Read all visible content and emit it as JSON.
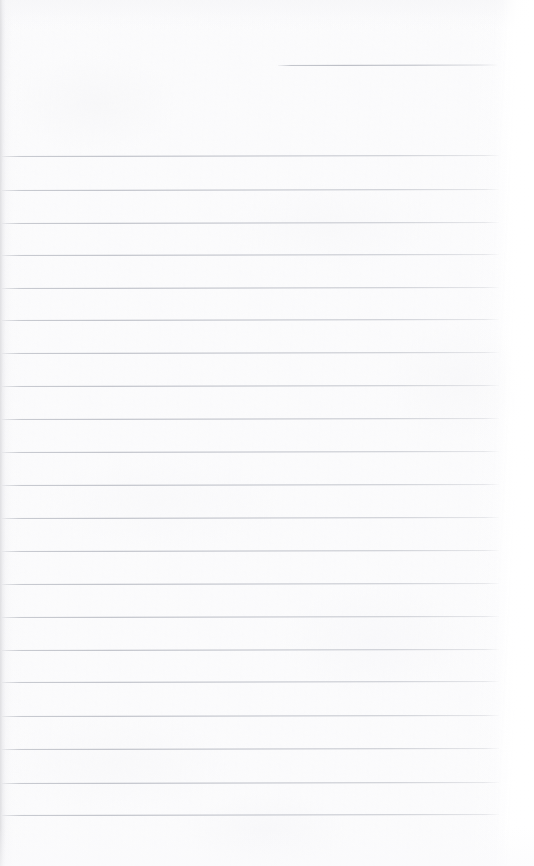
{
  "document": {
    "kind": "scanned-ruled-notepad-page",
    "title": "",
    "page_width": 534,
    "page_height": 866,
    "is_blank": true,
    "visible_text": "",
    "written_lines": []
  },
  "colors": {
    "paper": "#fbfbfc",
    "paper_highlight": "#ffffff",
    "rule_line": "#b4b7c0",
    "rule_line_faint": "#c8cad1",
    "left_edge_band": "#dedee1",
    "right_margin": "#ffffff"
  },
  "ruling": {
    "line_count": 22,
    "line_spacing_px": 32.8,
    "line_thickness_px": 1,
    "line_start_x": 2,
    "line_end_x": 499,
    "first_full_line_y": 156,
    "last_line_y": 815,
    "tilt_deg": -0.11,
    "partial_top_line": {
      "y": 65,
      "start_x": 278,
      "end_x": 498,
      "note": "short rule in upper-right, shorter than the full-width rules"
    },
    "lines": [
      {
        "index": 0,
        "y": 65,
        "x1": 278,
        "x2": 498,
        "partial": true
      },
      {
        "index": 1,
        "y": 156,
        "x1": 2,
        "x2": 499,
        "partial": false
      },
      {
        "index": 2,
        "y": 190,
        "x1": 2,
        "x2": 499,
        "partial": false
      },
      {
        "index": 3,
        "y": 223,
        "x1": 2,
        "x2": 499,
        "partial": false
      },
      {
        "index": 4,
        "y": 255,
        "x1": 2,
        "x2": 499,
        "partial": false
      },
      {
        "index": 5,
        "y": 288,
        "x1": 2,
        "x2": 499,
        "partial": false
      },
      {
        "index": 6,
        "y": 320,
        "x1": 2,
        "x2": 499,
        "partial": false
      },
      {
        "index": 7,
        "y": 353,
        "x1": 2,
        "x2": 499,
        "partial": false
      },
      {
        "index": 8,
        "y": 386,
        "x1": 2,
        "x2": 499,
        "partial": false
      },
      {
        "index": 9,
        "y": 419,
        "x1": 2,
        "x2": 499,
        "partial": false
      },
      {
        "index": 10,
        "y": 452,
        "x1": 2,
        "x2": 499,
        "partial": false
      },
      {
        "index": 11,
        "y": 485,
        "x1": 2,
        "x2": 499,
        "partial": false
      },
      {
        "index": 12,
        "y": 518,
        "x1": 2,
        "x2": 499,
        "partial": false
      },
      {
        "index": 13,
        "y": 551,
        "x1": 2,
        "x2": 499,
        "partial": false
      },
      {
        "index": 14,
        "y": 584,
        "x1": 2,
        "x2": 499,
        "partial": false
      },
      {
        "index": 15,
        "y": 617,
        "x1": 2,
        "x2": 499,
        "partial": false
      },
      {
        "index": 16,
        "y": 650,
        "x1": 2,
        "x2": 499,
        "partial": false
      },
      {
        "index": 17,
        "y": 682,
        "x1": 2,
        "x2": 499,
        "partial": false
      },
      {
        "index": 18,
        "y": 716,
        "x1": 2,
        "x2": 499,
        "partial": false
      },
      {
        "index": 19,
        "y": 749,
        "x1": 2,
        "x2": 499,
        "partial": false
      },
      {
        "index": 20,
        "y": 783,
        "x1": 2,
        "x2": 499,
        "partial": false
      },
      {
        "index": 21,
        "y": 815,
        "x1": 2,
        "x2": 499,
        "partial": false
      }
    ]
  },
  "edges": {
    "left_band_width": 6,
    "right_margin_width": 32,
    "bottom_blank_height": 51
  }
}
